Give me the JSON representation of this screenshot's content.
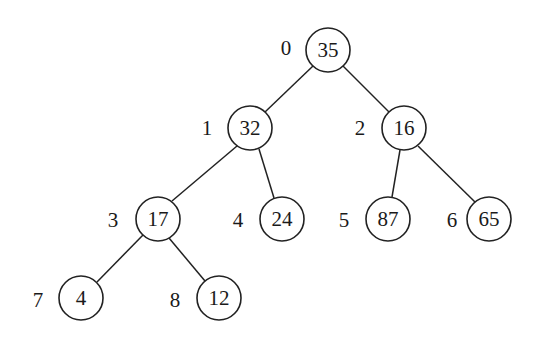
{
  "diagram": {
    "type": "binary-tree",
    "nodes": [
      {
        "index": "0",
        "value": "35"
      },
      {
        "index": "1",
        "value": "32"
      },
      {
        "index": "2",
        "value": "16"
      },
      {
        "index": "3",
        "value": "17"
      },
      {
        "index": "4",
        "value": "24"
      },
      {
        "index": "5",
        "value": "87"
      },
      {
        "index": "6",
        "value": "65"
      },
      {
        "index": "7",
        "value": "4"
      },
      {
        "index": "8",
        "value": "12"
      }
    ],
    "edges": [
      [
        "0",
        "1"
      ],
      [
        "0",
        "2"
      ],
      [
        "1",
        "3"
      ],
      [
        "1",
        "4"
      ],
      [
        "2",
        "5"
      ],
      [
        "2",
        "6"
      ],
      [
        "3",
        "7"
      ],
      [
        "3",
        "8"
      ]
    ],
    "colors": {
      "stroke": "#222222",
      "background": "#ffffff"
    }
  }
}
